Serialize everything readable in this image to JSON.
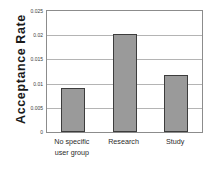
{
  "chart_data": {
    "type": "bar",
    "title": "",
    "xlabel": "",
    "ylabel": "Acceptance Rate",
    "categories": [
      "No specific user group",
      "Research",
      "Study"
    ],
    "category_lines": [
      [
        "No specific",
        "user group"
      ],
      [
        "Research",
        ""
      ],
      [
        "Study",
        ""
      ]
    ],
    "values": [
      0.0092,
      0.0203,
      0.0118
    ],
    "ylim": [
      0,
      0.025
    ],
    "yticks": [
      0,
      0.005,
      0.01,
      0.015,
      0.02,
      0.025
    ],
    "ytick_labels": [
      "0",
      "0.005",
      "0.01",
      "0.015",
      "0.02",
      "0.025"
    ],
    "grid": true,
    "legend": false,
    "bar_color": "#9a9a9a",
    "bar_border_color": "#3d3d3d",
    "gridline_color": "#b4b4b4",
    "frame_color": "#8c8c8c"
  }
}
